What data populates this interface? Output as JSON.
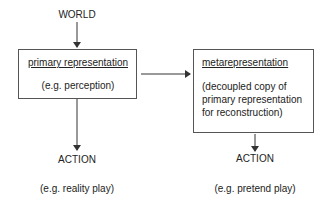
{
  "diagram": {
    "top_label": "WORLD",
    "primary_box": {
      "title": "primary representation",
      "subtitle": "(e.g. perception)"
    },
    "meta_box": {
      "title": "metarepresentation",
      "body_lines": [
        "(decoupled copy of",
        "primary representation",
        "for reconstruction)"
      ]
    },
    "left_output": {
      "label": "ACTION",
      "example": "(e.g. reality play)"
    },
    "right_output": {
      "label": "ACTION",
      "example": "(e.g. pretend play)"
    },
    "colors": {
      "line": "#333333",
      "text": "#222222",
      "border": "#555555"
    }
  }
}
